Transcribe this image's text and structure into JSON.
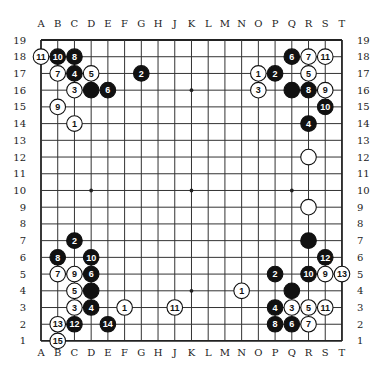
{
  "board": {
    "size": 19,
    "origin": {
      "x": 41,
      "y": 40
    },
    "spacing": 16.72,
    "stone_radius": 7.8,
    "line_color": "#333333",
    "frame_color": "#222222",
    "black_color": "#111111",
    "white_color": "#ffffff",
    "columns": [
      "A",
      "B",
      "C",
      "D",
      "E",
      "F",
      "G",
      "H",
      "J",
      "K",
      "L",
      "M",
      "N",
      "O",
      "P",
      "Q",
      "R",
      "S",
      "T"
    ],
    "rows": [
      "19",
      "18",
      "17",
      "16",
      "15",
      "14",
      "13",
      "12",
      "11",
      "10",
      "9",
      "8",
      "7",
      "6",
      "5",
      "4",
      "3",
      "2",
      "1"
    ],
    "star_points": [
      "D16",
      "K16",
      "Q16",
      "D10",
      "K10",
      "Q10",
      "D4",
      "K4",
      "Q4"
    ]
  },
  "stones": [
    {
      "pos": "A18",
      "color": "white",
      "label": "11"
    },
    {
      "pos": "B18",
      "color": "black",
      "label": "10"
    },
    {
      "pos": "C18",
      "color": "black",
      "label": "8"
    },
    {
      "pos": "B17",
      "color": "white",
      "label": "7"
    },
    {
      "pos": "C17",
      "color": "black",
      "label": "4"
    },
    {
      "pos": "D17",
      "color": "white",
      "label": "5"
    },
    {
      "pos": "C16",
      "color": "white",
      "label": "3"
    },
    {
      "pos": "D16",
      "color": "black",
      "label": ""
    },
    {
      "pos": "E16",
      "color": "black",
      "label": "6"
    },
    {
      "pos": "B15",
      "color": "white",
      "label": "9"
    },
    {
      "pos": "C14",
      "color": "white",
      "label": "1"
    },
    {
      "pos": "G17",
      "color": "black",
      "label": "2"
    },
    {
      "pos": "Q18",
      "color": "black",
      "label": "6"
    },
    {
      "pos": "R18",
      "color": "white",
      "label": "7"
    },
    {
      "pos": "S18",
      "color": "white",
      "label": "11"
    },
    {
      "pos": "O17",
      "color": "white",
      "label": "1"
    },
    {
      "pos": "P17",
      "color": "black",
      "label": "2"
    },
    {
      "pos": "R17",
      "color": "white",
      "label": "5"
    },
    {
      "pos": "O16",
      "color": "white",
      "label": "3"
    },
    {
      "pos": "Q16",
      "color": "black",
      "label": ""
    },
    {
      "pos": "R16",
      "color": "black",
      "label": "8"
    },
    {
      "pos": "S16",
      "color": "white",
      "label": "9"
    },
    {
      "pos": "S15",
      "color": "black",
      "label": "10"
    },
    {
      "pos": "R14",
      "color": "black",
      "label": "4"
    },
    {
      "pos": "R12",
      "color": "white",
      "label": ""
    },
    {
      "pos": "R9",
      "color": "white",
      "label": ""
    },
    {
      "pos": "R7",
      "color": "black",
      "label": ""
    },
    {
      "pos": "S6",
      "color": "black",
      "label": "12"
    },
    {
      "pos": "P5",
      "color": "black",
      "label": "2"
    },
    {
      "pos": "R5",
      "color": "black",
      "label": "10"
    },
    {
      "pos": "S5",
      "color": "white",
      "label": "9"
    },
    {
      "pos": "T5",
      "color": "white",
      "label": "13"
    },
    {
      "pos": "N4",
      "color": "white",
      "label": "1"
    },
    {
      "pos": "Q4",
      "color": "black",
      "label": ""
    },
    {
      "pos": "P3",
      "color": "black",
      "label": "4"
    },
    {
      "pos": "Q3",
      "color": "white",
      "label": "3"
    },
    {
      "pos": "R3",
      "color": "white",
      "label": "5"
    },
    {
      "pos": "S3",
      "color": "white",
      "label": "11"
    },
    {
      "pos": "P2",
      "color": "black",
      "label": "8"
    },
    {
      "pos": "Q2",
      "color": "black",
      "label": "6"
    },
    {
      "pos": "R2",
      "color": "white",
      "label": "7"
    },
    {
      "pos": "J3",
      "color": "white",
      "label": "11"
    },
    {
      "pos": "C7",
      "color": "black",
      "label": "2"
    },
    {
      "pos": "B6",
      "color": "black",
      "label": "8"
    },
    {
      "pos": "D6",
      "color": "black",
      "label": "10"
    },
    {
      "pos": "B5",
      "color": "white",
      "label": "7"
    },
    {
      "pos": "C5",
      "color": "white",
      "label": "9"
    },
    {
      "pos": "D5",
      "color": "black",
      "label": "6"
    },
    {
      "pos": "C4",
      "color": "white",
      "label": "5"
    },
    {
      "pos": "D4",
      "color": "black",
      "label": ""
    },
    {
      "pos": "C3",
      "color": "white",
      "label": "3"
    },
    {
      "pos": "D3",
      "color": "black",
      "label": "4"
    },
    {
      "pos": "F3",
      "color": "white",
      "label": "1"
    },
    {
      "pos": "B2",
      "color": "white",
      "label": "13"
    },
    {
      "pos": "C2",
      "color": "black",
      "label": "12"
    },
    {
      "pos": "E2",
      "color": "black",
      "label": "14"
    },
    {
      "pos": "B1",
      "color": "white",
      "label": "15"
    }
  ]
}
